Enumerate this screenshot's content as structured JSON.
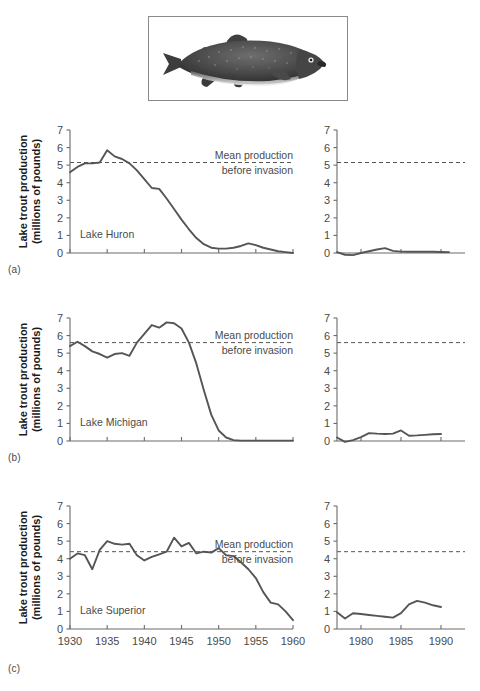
{
  "figure": {
    "photo_caption": "lake-trout-photograph",
    "ylabel_line1": "Lake trout production",
    "ylabel_line2": "(millions of pounds)",
    "mean_note_line1": "Mean production",
    "mean_note_line2": "before invasion",
    "panel_letters": [
      "(a)",
      "(b)",
      "(c)"
    ],
    "colors": {
      "line": "#555555",
      "axis": "#6b6b6b",
      "text": "#4a4a4a",
      "label": "#1a1a1a",
      "frame": "#8a8a8a"
    }
  },
  "chart_data": [
    {
      "type": "line",
      "panel": "(a)",
      "title": "Lake Huron",
      "xlabel": "",
      "ylabel": "Lake trout production (millions of pounds)",
      "ylim": [
        0,
        7
      ],
      "yticks": [
        0,
        1,
        2,
        3,
        4,
        5,
        6,
        7
      ],
      "grid": false,
      "legend": "none",
      "annotations": [
        "Mean production before invasion"
      ],
      "left_subplot": {
        "xlim": [
          1930,
          1960
        ],
        "xticks": [
          1930,
          1935,
          1940,
          1945,
          1950,
          1955,
          1960
        ],
        "xtick_labels_shown": false,
        "mean_line": 5.15,
        "x": [
          1930,
          1931,
          1932,
          1933,
          1934,
          1935,
          1936,
          1937,
          1938,
          1939,
          1940,
          1941,
          1942,
          1943,
          1944,
          1945,
          1946,
          1947,
          1948,
          1949,
          1950,
          1951,
          1952,
          1953,
          1954,
          1955,
          1956,
          1957,
          1958,
          1959,
          1960
        ],
        "y": [
          4.6,
          4.9,
          5.1,
          5.1,
          5.15,
          5.85,
          5.5,
          5.35,
          5.1,
          4.7,
          4.2,
          3.7,
          3.65,
          3.1,
          2.5,
          1.9,
          1.35,
          0.85,
          0.5,
          0.3,
          0.25,
          0.25,
          0.3,
          0.4,
          0.55,
          0.45,
          0.3,
          0.2,
          0.1,
          0.05,
          0.0
        ]
      },
      "right_subplot": {
        "xlim": [
          1977,
          1993
        ],
        "xticks": [
          1980,
          1985,
          1990
        ],
        "xtick_labels_shown": false,
        "mean_line": 5.15,
        "x": [
          1977,
          1978,
          1979,
          1980,
          1981,
          1982,
          1983,
          1984,
          1985,
          1986,
          1987,
          1988,
          1989,
          1990,
          1991
        ],
        "y": [
          0.05,
          -0.1,
          -0.12,
          0.0,
          0.1,
          0.2,
          0.28,
          0.12,
          0.08,
          0.07,
          0.07,
          0.07,
          0.07,
          0.06,
          0.05
        ]
      }
    },
    {
      "type": "line",
      "panel": "(b)",
      "title": "Lake Michigan",
      "xlabel": "",
      "ylabel": "Lake trout production (millions of pounds)",
      "ylim": [
        0,
        7
      ],
      "yticks": [
        0,
        1,
        2,
        3,
        4,
        5,
        6,
        7
      ],
      "grid": false,
      "legend": "none",
      "annotations": [
        "Mean production before invasion"
      ],
      "left_subplot": {
        "xlim": [
          1930,
          1960
        ],
        "xticks": [
          1930,
          1935,
          1940,
          1945,
          1950,
          1955,
          1960
        ],
        "xtick_labels_shown": false,
        "mean_line": 5.6,
        "x": [
          1930,
          1931,
          1932,
          1933,
          1934,
          1935,
          1936,
          1937,
          1938,
          1939,
          1940,
          1941,
          1942,
          1943,
          1944,
          1945,
          1946,
          1947,
          1948,
          1949,
          1950,
          1951,
          1952,
          1953,
          1954,
          1955,
          1956,
          1957,
          1958,
          1959,
          1960
        ],
        "y": [
          5.4,
          5.65,
          5.4,
          5.1,
          4.95,
          4.75,
          4.95,
          5.0,
          4.85,
          5.6,
          6.1,
          6.6,
          6.45,
          6.75,
          6.7,
          6.4,
          5.6,
          4.4,
          2.9,
          1.5,
          0.6,
          0.2,
          0.05,
          0.02,
          0.02,
          0.02,
          0.02,
          0.02,
          0.02,
          0.02,
          0.02
        ]
      },
      "right_subplot": {
        "xlim": [
          1977,
          1993
        ],
        "xticks": [
          1980,
          1985,
          1990
        ],
        "xtick_labels_shown": false,
        "mean_line": 5.6,
        "x": [
          1977,
          1978,
          1979,
          1980,
          1981,
          1982,
          1983,
          1984,
          1985,
          1986,
          1987,
          1988,
          1989,
          1990
        ],
        "y": [
          0.2,
          -0.05,
          0.05,
          0.22,
          0.45,
          0.42,
          0.4,
          0.42,
          0.6,
          0.3,
          0.32,
          0.35,
          0.38,
          0.4
        ]
      }
    },
    {
      "type": "line",
      "panel": "(c)",
      "title": "Lake Superior",
      "xlabel": "",
      "ylabel": "Lake trout production (millions of pounds)",
      "ylim": [
        0,
        7
      ],
      "yticks": [
        0,
        1,
        2,
        3,
        4,
        5,
        6,
        7
      ],
      "grid": false,
      "legend": "none",
      "annotations": [
        "Mean production before invasion"
      ],
      "left_subplot": {
        "xlim": [
          1930,
          1960
        ],
        "xticks": [
          1930,
          1935,
          1940,
          1945,
          1950,
          1955,
          1960
        ],
        "xtick_labels": [
          "1930",
          "1935",
          "1940",
          "1945",
          "1950",
          "1955",
          "1960"
        ],
        "xtick_labels_shown": true,
        "mean_line": 4.4,
        "x": [
          1930,
          1931,
          1932,
          1933,
          1934,
          1935,
          1936,
          1937,
          1938,
          1939,
          1940,
          1941,
          1942,
          1943,
          1944,
          1945,
          1946,
          1947,
          1948,
          1949,
          1950,
          1951,
          1952,
          1953,
          1954,
          1955,
          1956,
          1957,
          1958,
          1959,
          1960
        ],
        "y": [
          4.0,
          4.3,
          4.2,
          3.4,
          4.5,
          5.0,
          4.85,
          4.8,
          4.85,
          4.2,
          3.9,
          4.1,
          4.25,
          4.4,
          5.2,
          4.7,
          4.9,
          4.3,
          4.4,
          4.35,
          4.6,
          4.2,
          4.15,
          3.8,
          3.4,
          2.9,
          2.1,
          1.5,
          1.4,
          1.0,
          0.5
        ]
      },
      "right_subplot": {
        "xlim": [
          1977,
          1993
        ],
        "xticks": [
          1980,
          1985,
          1990
        ],
        "xtick_labels": [
          "1980",
          "1985",
          "1990"
        ],
        "xtick_labels_shown": true,
        "mean_line": 4.4,
        "x": [
          1977,
          1978,
          1979,
          1980,
          1981,
          1982,
          1983,
          1984,
          1985,
          1986,
          1987,
          1988,
          1989,
          1990
        ],
        "y": [
          0.95,
          0.6,
          0.9,
          0.85,
          0.8,
          0.75,
          0.7,
          0.65,
          0.9,
          1.4,
          1.6,
          1.5,
          1.35,
          1.25
        ]
      }
    }
  ]
}
